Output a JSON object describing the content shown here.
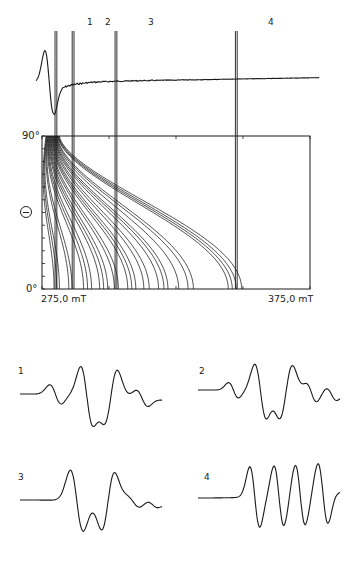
{
  "chart_data": [
    {
      "id": "absorption_derivative_spectrum",
      "type": "line",
      "title": "",
      "xlabel": "Magnetic field",
      "ylabel": "",
      "xlim": [
        275.0,
        375.0
      ],
      "x_unit": "mT",
      "description": "Experimental first-derivative powder EPR spectrum with a strong positive lobe at low field, a negative trough, then a noisy nearly flat baseline rising slightly to high field",
      "markers": [
        {
          "label": "1",
          "field_mT": 280.2
        },
        {
          "label": "2",
          "field_mT": 286.6
        },
        {
          "label": "3",
          "field_mT": 302.6
        },
        {
          "label": "4",
          "field_mT": 347.5
        }
      ]
    },
    {
      "id": "angular_dependence_diagram",
      "type": "line",
      "title": "",
      "xlabel": "",
      "ylabel": "Θ",
      "x_tick_labels": [
        "275,0 mT",
        "375,0 mT"
      ],
      "xlim": [
        275.0,
        375.0
      ],
      "y_tick_labels": [
        "0°",
        "90°"
      ],
      "ylim": [
        0,
        90
      ],
      "grid": false,
      "description": "Family of ~24 resonance field curves B(Θ); all converge near 277–282 mT at Θ=90° and spread out to 279–365 mT at Θ=0°",
      "series_count": 24,
      "endpoints_theta0_mT": [
        279.5,
        280.5,
        281.5,
        285.0,
        286.2,
        290.5,
        292.0,
        293.5,
        296.5,
        298.0,
        299.5,
        302.0,
        303.5,
        307.0,
        308.5,
        310.0,
        313.0,
        315.0,
        318.5,
        320.5,
        322.0,
        326.0,
        329.5,
        331.5
      ],
      "endpoints_theta0_mT_high_group": [
        344.5,
        346.0,
        347.5,
        349.5
      ],
      "endpoints_theta90_mT": [
        276.5,
        281.5
      ],
      "vertical_markers_mT": [
        280.2,
        286.6,
        302.6,
        347.5
      ]
    },
    {
      "id": "single_crystal_spectra",
      "type": "line",
      "title": "",
      "panels": [
        {
          "label": "1",
          "peaks": 2,
          "troughs": 2,
          "description": "small shoulder, strong positive peak, two negative troughs with intermediate positive peak, gentle high-field shoulder"
        },
        {
          "label": "2",
          "peaks": 3,
          "troughs": 2,
          "description": "small shoulder, strong peak, trough, peak, deep trough, then two small ripples rising to baseline"
        },
        {
          "label": "3",
          "peaks": 2,
          "troughs": 2,
          "description": "rising edge to strong peak, trough, second peak, deep trough, noisy shoulder returning to baseline"
        },
        {
          "label": "4",
          "peaks": 4,
          "troughs": 4,
          "description": "four nearly equal-amplitude resolved hyperfine oscillations"
        }
      ]
    }
  ],
  "labels": {
    "markers": [
      "1",
      "2",
      "3",
      "4"
    ],
    "y_top": "90°",
    "y_bottom": "0°",
    "y_axis_symbol": "Θ",
    "x_left": "275,0 mT",
    "x_right": "375,0 mT",
    "panels": [
      "1",
      "2",
      "3",
      "4"
    ]
  },
  "colors": {
    "ink": "#1a1a1a",
    "background": "#ffffff"
  }
}
